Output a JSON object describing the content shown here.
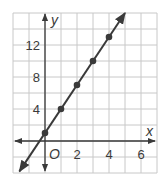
{
  "chart_data": {
    "type": "line",
    "title": "",
    "xlabel": "x",
    "ylabel": "y",
    "origin_label": "O",
    "xlim": [
      -2,
      7
    ],
    "ylim": [
      -4,
      16
    ],
    "x_ticks": [
      2,
      4,
      6
    ],
    "y_ticks": [
      4,
      8,
      12
    ],
    "x_grid_step": 1,
    "y_grid_step": 2,
    "grid": true,
    "legend": null,
    "series": [
      {
        "name": "line",
        "equation": "y = 3x + 1",
        "x": [
          0,
          1,
          2,
          3,
          4
        ],
        "y": [
          1,
          4,
          7,
          10,
          13
        ],
        "markers": true,
        "arrows_both_ends": true
      }
    ]
  },
  "colors": {
    "grid": "#c8c8c8",
    "axis": "#3a3a3a",
    "line": "#3a3a3a",
    "marker": "#3a3a3a",
    "background": "#ffffff"
  }
}
